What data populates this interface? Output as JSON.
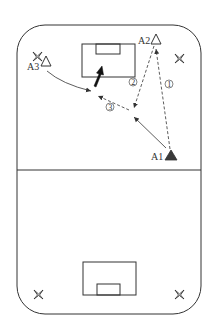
{
  "diagram": {
    "type": "soccer-drill",
    "colors": {
      "line": "#333333",
      "background": "#ffffff",
      "player_filled": "#3a3a3a",
      "player_open": "#ffffff"
    },
    "players": [
      {
        "id": "A1",
        "label": "A1",
        "style": "filled-triangle"
      },
      {
        "id": "A2",
        "label": "A2",
        "style": "open-triangle"
      },
      {
        "id": "A3",
        "label": "A3",
        "style": "open-triangle"
      }
    ],
    "steps": [
      {
        "label": "①",
        "description": "A1 passes to A2 (dashed)"
      },
      {
        "label": "②",
        "description": "A2 passes back toward center (dashed)"
      },
      {
        "label": "③",
        "description": "A3 runs / exchange with A1 (solid & dashed)"
      }
    ],
    "markers": {
      "cone_icon": "star-cone",
      "shot_arrow": "bold-arrow-toward-goal"
    },
    "field": {
      "halves": [
        "top",
        "bottom"
      ],
      "goals": [
        "top-goal",
        "bottom-goal"
      ]
    }
  }
}
